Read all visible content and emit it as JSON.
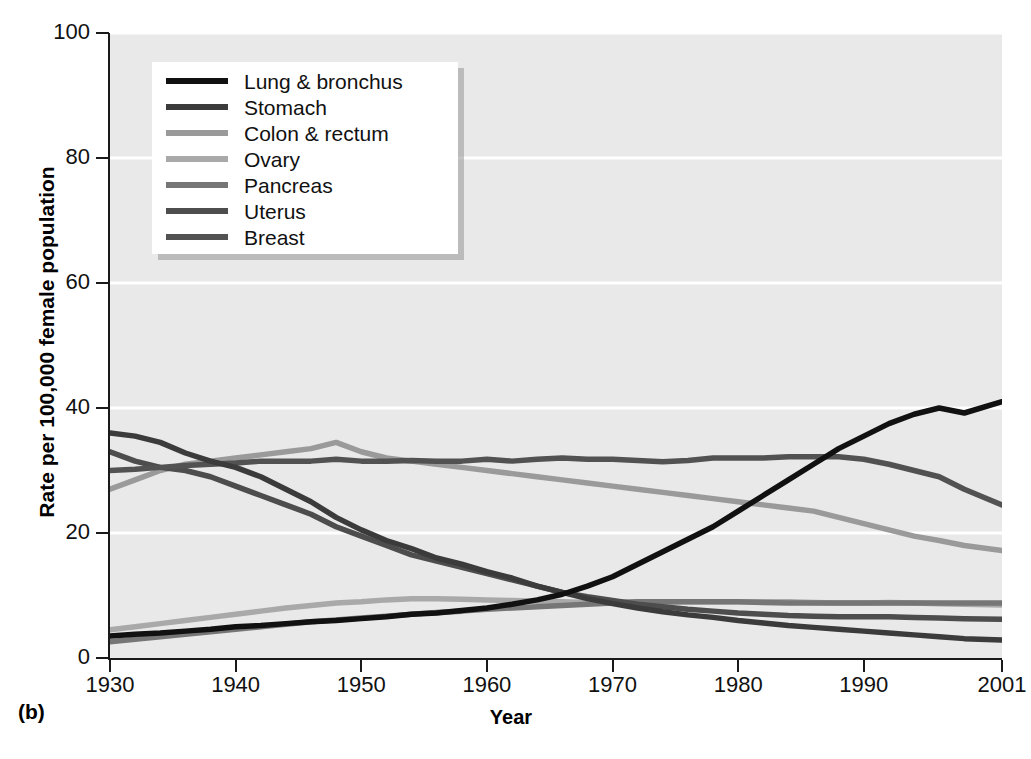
{
  "panel": {
    "label": "(b)"
  },
  "axes": {
    "y_title": "Rate per 100,000 female population",
    "x_title": "Year",
    "y_ticks": [
      "0",
      "20",
      "40",
      "60",
      "80",
      "100"
    ],
    "x_ticks": [
      "1930",
      "1940",
      "1950",
      "1960",
      "1970",
      "1980",
      "1990",
      "2001"
    ]
  },
  "legend": {
    "entries": [
      {
        "label": "Lung & bronchus",
        "color": "#111111"
      },
      {
        "label": "Stomach",
        "color": "#3b3b3b"
      },
      {
        "label": "Colon & rectum",
        "color": "#9a9a9a"
      },
      {
        "label": "Ovary",
        "color": "#a9a9a9"
      },
      {
        "label": "Pancreas",
        "color": "#767676"
      },
      {
        "label": "Uterus",
        "color": "#4d4d4d"
      },
      {
        "label": "Breast",
        "color": "#525252"
      }
    ]
  },
  "chart_data": {
    "type": "line",
    "title": "",
    "xlabel": "Year",
    "ylabel": "Rate per 100,000 female population",
    "xlim": [
      1930,
      2001
    ],
    "ylim": [
      0,
      100
    ],
    "ytick_values": [
      0,
      20,
      40,
      60,
      80,
      100
    ],
    "xtick_values": [
      1930,
      1940,
      1950,
      1960,
      1970,
      1980,
      1990,
      2001
    ],
    "grid": "horizontal-white",
    "legend_position": "upper-left-inside",
    "x": [
      1930,
      1932,
      1934,
      1936,
      1938,
      1940,
      1942,
      1944,
      1946,
      1948,
      1950,
      1952,
      1954,
      1956,
      1958,
      1960,
      1962,
      1964,
      1966,
      1968,
      1970,
      1972,
      1974,
      1976,
      1978,
      1980,
      1982,
      1984,
      1986,
      1988,
      1990,
      1992,
      1994,
      1996,
      1998,
      2001
    ],
    "series": [
      {
        "name": "Lung & bronchus",
        "color": "#111111",
        "values": [
          3.5,
          3.8,
          4.0,
          4.3,
          4.6,
          5.0,
          5.2,
          5.5,
          5.8,
          6.0,
          6.3,
          6.6,
          7.0,
          7.2,
          7.6,
          8.0,
          8.6,
          9.3,
          10.2,
          11.5,
          13.0,
          15.0,
          17.0,
          19.0,
          21.0,
          23.5,
          26.0,
          28.5,
          31.0,
          33.5,
          35.5,
          37.5,
          39.0,
          40.0,
          39.2,
          41.0
        ]
      },
      {
        "name": "Stomach",
        "color": "#3b3b3b",
        "values": [
          36.0,
          35.5,
          34.5,
          32.8,
          31.5,
          30.5,
          29.0,
          27.0,
          25.0,
          22.5,
          20.5,
          18.8,
          17.5,
          16.0,
          15.0,
          13.8,
          12.8,
          11.5,
          10.5,
          9.5,
          8.7,
          8.0,
          7.4,
          6.9,
          6.5,
          6.0,
          5.6,
          5.2,
          4.9,
          4.6,
          4.3,
          4.0,
          3.7,
          3.4,
          3.1,
          2.9
        ]
      },
      {
        "name": "Colon & rectum",
        "color": "#9a9a9a",
        "values": [
          27.0,
          28.5,
          30.0,
          31.0,
          31.5,
          32.0,
          32.5,
          33.0,
          33.5,
          34.5,
          33.0,
          32.0,
          31.5,
          31.0,
          30.5,
          30.0,
          29.5,
          29.0,
          28.5,
          28.0,
          27.5,
          27.0,
          26.5,
          26.0,
          25.5,
          25.0,
          24.5,
          24.0,
          23.5,
          22.5,
          21.5,
          20.5,
          19.5,
          18.8,
          18.0,
          17.2
        ]
      },
      {
        "name": "Ovary",
        "color": "#a9a9a9",
        "values": [
          4.5,
          5.0,
          5.5,
          6.0,
          6.5,
          7.0,
          7.5,
          8.0,
          8.4,
          8.8,
          9.0,
          9.3,
          9.5,
          9.5,
          9.4,
          9.3,
          9.2,
          9.1,
          9.0,
          8.9,
          8.9,
          9.0,
          9.0,
          9.0,
          9.0,
          9.0,
          9.0,
          9.0,
          8.9,
          8.8,
          8.8,
          8.9,
          8.8,
          8.7,
          8.6,
          8.5
        ]
      },
      {
        "name": "Pancreas",
        "color": "#767676",
        "values": [
          2.6,
          3.0,
          3.4,
          3.8,
          4.2,
          4.6,
          5.0,
          5.4,
          5.8,
          6.1,
          6.4,
          6.7,
          7.0,
          7.3,
          7.5,
          7.8,
          8.0,
          8.2,
          8.4,
          8.6,
          8.8,
          9.0,
          9.0,
          9.0,
          9.0,
          9.0,
          8.9,
          8.8,
          8.8,
          8.8,
          8.8,
          8.8,
          8.8,
          8.8,
          8.8,
          8.8
        ]
      },
      {
        "name": "Uterus",
        "color": "#4d4d4d",
        "values": [
          33.0,
          31.5,
          30.5,
          30.0,
          29.0,
          27.5,
          26.0,
          24.5,
          23.0,
          21.0,
          19.5,
          18.0,
          16.5,
          15.5,
          14.5,
          13.5,
          12.5,
          11.5,
          10.5,
          9.8,
          9.2,
          8.6,
          8.2,
          7.8,
          7.5,
          7.2,
          7.0,
          6.8,
          6.7,
          6.6,
          6.6,
          6.6,
          6.5,
          6.4,
          6.3,
          6.2
        ]
      },
      {
        "name": "Breast",
        "color": "#525252",
        "values": [
          30.0,
          30.2,
          30.5,
          30.8,
          31.0,
          31.2,
          31.5,
          31.5,
          31.5,
          31.8,
          31.5,
          31.5,
          31.6,
          31.5,
          31.5,
          31.8,
          31.5,
          31.8,
          32.0,
          31.8,
          31.8,
          31.6,
          31.4,
          31.6,
          32.0,
          32.0,
          32.0,
          32.2,
          32.2,
          32.2,
          31.8,
          31.0,
          30.0,
          29.0,
          27.0,
          24.5
        ]
      }
    ]
  }
}
